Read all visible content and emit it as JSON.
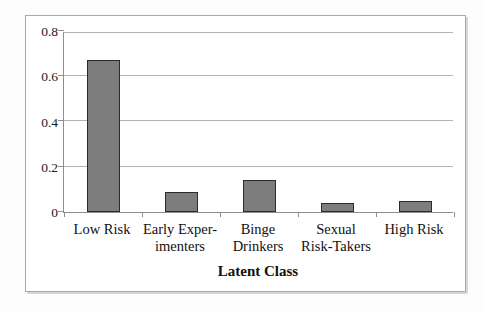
{
  "chart_data": {
    "type": "bar",
    "categories": [
      "Low Risk",
      "Early Exper-\nimenters",
      "Binge\nDrinkers",
      "Sexual\nRisk-Takers",
      "High Risk"
    ],
    "values": [
      0.67,
      0.09,
      0.14,
      0.04,
      0.05
    ],
    "title": "",
    "xlabel": "Latent Class",
    "ylabel": "",
    "ylim": [
      0,
      0.8
    ],
    "yticks": [
      0,
      0.2,
      0.4,
      0.6,
      0.8
    ],
    "ytick_labels": [
      "0",
      "0.2",
      "0.4",
      "0.6",
      "0.8"
    ],
    "grid": true,
    "legend": "none",
    "colors": {
      "bar_fill": "#7d7d7d",
      "bar_border": "#2b2b2b",
      "gridline": "#b4b4b4",
      "axis": "#8f8f8f",
      "frame_border": "#a9a9a9",
      "text": "#111111"
    }
  }
}
